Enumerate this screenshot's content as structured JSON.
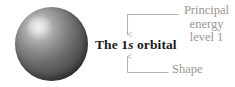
{
  "figure": {
    "background_color": "#ffffff",
    "width": 235,
    "height": 87
  },
  "sphere": {
    "name": "1s orbital sphere",
    "shape": "sphere",
    "fill_color": "#5a5a5a",
    "highlight_color": "#e8e8e8",
    "shadow_color": "#343434"
  },
  "main_label": {
    "prefix": "The 1",
    "variable": "s",
    "suffix": " orbital",
    "full_text": "The 1s orbital",
    "color": "#1b1b1b"
  },
  "annotations": {
    "principal": {
      "lines": [
        "Principal",
        "energy",
        "level 1"
      ],
      "full_text": "Principal energy level 1",
      "color": "#9a9794",
      "points_to": "1"
    },
    "shape": {
      "label": "Shape",
      "color": "#9a9794",
      "points_to": "s"
    }
  },
  "leaders": {
    "line_color": "#b3b0ad",
    "top": {
      "name": "principal-energy-level-leader",
      "arrow_direction": "down"
    },
    "bottom": {
      "name": "shape-leader",
      "arrow_direction": "up"
    }
  }
}
